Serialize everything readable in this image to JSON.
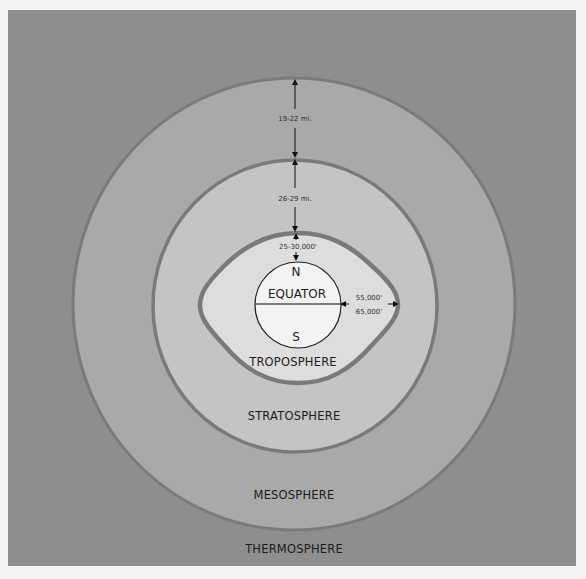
{
  "diagram": {
    "colors": {
      "page_background": "#f4f4f4",
      "thermosphere": "#8e8e8e",
      "mesosphere": "#a9a9a9",
      "stratosphere": "#c4c4c4",
      "troposphere": "#dddddd",
      "boundary_stroke": "#777777",
      "earth": "#f3f3f3",
      "text": "#1c1c1c"
    },
    "layers": {
      "thermosphere": "THERMOSPHERE",
      "mesosphere": "MESOSPHERE",
      "stratosphere": "STRATOSPHERE",
      "troposphere": "TROPOSPHERE"
    },
    "earth": {
      "north": "N",
      "south": "S",
      "equator": "EQUATOR"
    },
    "dimensions": {
      "mesosphere_thickness": "19-22 mi.",
      "stratosphere_thickness": "26-29 mi.",
      "troposphere_polar_height": "25-30,000'",
      "troposphere_equatorial_height_low": "55,000'",
      "troposphere_equatorial_height_high": "65,000'"
    }
  }
}
